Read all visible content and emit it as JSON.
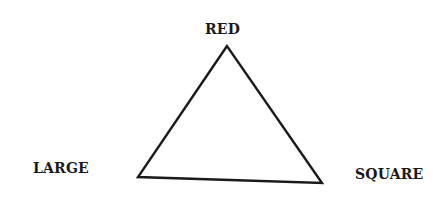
{
  "diagram": {
    "type": "triangle",
    "vertices": {
      "top": {
        "label": "RED"
      },
      "bottom_left": {
        "label": "LARGE"
      },
      "bottom_right": {
        "label": "SQUARE"
      }
    },
    "stroke_color": "#1a1a1a",
    "background_color": "#ffffff"
  }
}
